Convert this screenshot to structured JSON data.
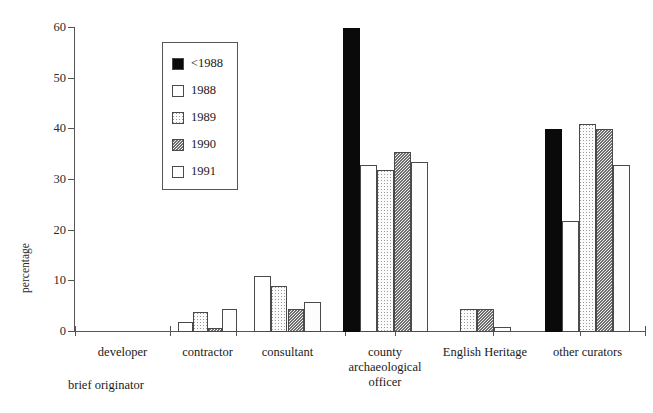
{
  "chart_data": {
    "type": "bar",
    "title": "",
    "xlabel": "brief originator",
    "ylabel": "percentage",
    "ylim": [
      0,
      60
    ],
    "yticks": [
      0,
      10,
      20,
      30,
      40,
      50,
      60
    ],
    "grid": false,
    "legend_position": "upper-left-inset",
    "categories": [
      "developer",
      "contractor",
      "consultant",
      "county archaeological officer",
      "English Heritage",
      "other curators"
    ],
    "category_lines": [
      [
        "developer"
      ],
      [
        "contractor"
      ],
      [
        "consultant"
      ],
      [
        "county",
        "archaeological",
        "officer"
      ],
      [
        "English Heritage"
      ],
      [
        "other curators"
      ]
    ],
    "series": [
      {
        "name": "<1988",
        "fill": "solid-black",
        "values": [
          0,
          0,
          0,
          60,
          0,
          40
        ]
      },
      {
        "name": "1988",
        "fill": "white",
        "values": [
          0,
          2,
          11,
          33,
          0,
          22
        ]
      },
      {
        "name": "1989",
        "fill": "light-dotted",
        "values": [
          0,
          4,
          9,
          32,
          4.5,
          41
        ]
      },
      {
        "name": "1990",
        "fill": "dark-dotted",
        "values": [
          0,
          0.7,
          4.5,
          35.5,
          4.5,
          40
        ]
      },
      {
        "name": "1991",
        "fill": "pale-dotted",
        "values": [
          0,
          4.5,
          6,
          33.5,
          1,
          33
        ]
      }
    ]
  },
  "colors": {
    "axis": "#555555",
    "bar_outline": "#4a4a4a",
    "series_black": "#0a0a0a",
    "series_white": "#ffffff",
    "series_light_dot": "#9a9a9a",
    "series_dark_dot": "#6f6f6f",
    "series_pale_dot": "#d2d2d2",
    "background": "#ffffff",
    "text": "#1a1a1a"
  }
}
